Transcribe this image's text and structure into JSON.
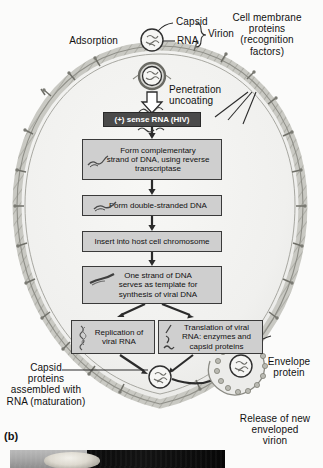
{
  "figure": {
    "panel_label": "(b)"
  },
  "annotations": {
    "adsorption": "Adsorption",
    "capsid": "Capsid",
    "rna": "RNA",
    "virion": "Virion",
    "membrane_proteins": {
      "line1": "Cell membrane",
      "line2": "proteins",
      "line3": "(recognition",
      "line4": "factors)"
    },
    "penetration": {
      "line1": "Penetration",
      "line2": "uncoating"
    },
    "capsid_assembly": {
      "line1": "Capsid",
      "line2": "proteins",
      "line3": "assembled with",
      "line4": "RNA (maturation)"
    },
    "envelope_protein": {
      "line1": "Envelope",
      "line2": "protein"
    },
    "release": {
      "line1": "Release of new",
      "line2": "enveloped",
      "line3": "virion"
    }
  },
  "flowchart": {
    "steps": [
      {
        "id": "sense-rna",
        "style": "dark",
        "lines": [
          "(+) sense RNA (HIV)"
        ]
      },
      {
        "id": "reverse-transcriptase",
        "style": "light",
        "icon": "rna-squiggle-icon",
        "lines": [
          "Form complementary",
          "strand of DNA, using reverse",
          "transcriptase"
        ]
      },
      {
        "id": "double-stranded-dna",
        "style": "light",
        "icon": "dna-squiggle-icon",
        "lines": [
          "Form double-stranded DNA"
        ]
      },
      {
        "id": "insert-host-chromosome",
        "style": "light",
        "lines": [
          "Insert into host cell chromosome"
        ]
      },
      {
        "id": "template-synthesis",
        "style": "light",
        "icon": "dna-strand-icon",
        "lines": [
          "One strand of DNA",
          "serves as template for",
          "synthesis of viral DNA"
        ]
      },
      {
        "id": "replication-viral-rna",
        "style": "light",
        "icon": "rna-coil-icon",
        "lines": [
          "Replication of",
          "viral RNA"
        ]
      },
      {
        "id": "translation-viral-rna",
        "style": "light",
        "icon": "protein-icon",
        "lines": [
          "Translation of viral",
          "RNA: enzymes and",
          "capsid proteins"
        ]
      }
    ]
  },
  "colors": {
    "background": "#fbfbfa",
    "box_fill": "#cfcfcf",
    "box_border": "#3a3a3a",
    "dark_box_fill": "#4a4a4a",
    "dark_box_text": "#ffffff",
    "cell_interior": "#f3f3f1",
    "membrane": "#b4b4ae",
    "text": "#111111",
    "arrow": "#2b2b2b"
  }
}
